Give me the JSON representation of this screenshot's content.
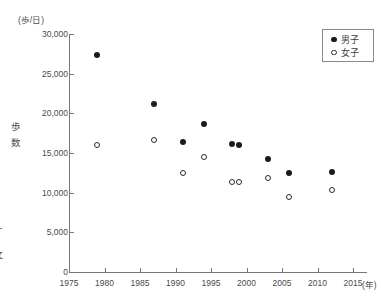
{
  "labels": {
    "y_unit": "(歩/日)",
    "y_axis": "歩数",
    "x_unit": "(年)"
  },
  "legend": {
    "items": [
      {
        "label": "男子",
        "marker": "filled-circle"
      },
      {
        "label": "女子",
        "marker": "open-circle"
      }
    ]
  },
  "edge_fragments": [
    "ー",
    "●",
    "攵"
  ],
  "chart_data": {
    "type": "scatter",
    "title": "",
    "xlabel": "(年)",
    "ylabel": "歩数 (歩/日)",
    "xlim": [
      1975,
      2017
    ],
    "ylim": [
      0,
      30000
    ],
    "x_ticks": [
      1975,
      1980,
      1985,
      1990,
      1995,
      2000,
      2005,
      2010,
      2015
    ],
    "y_ticks": [
      0,
      5000,
      10000,
      15000,
      20000,
      25000,
      30000
    ],
    "grid": false,
    "legend_position": "top-right",
    "series": [
      {
        "id": "boys",
        "name": "男子",
        "marker": "filled-circle",
        "points": [
          [
            1979,
            27400
          ],
          [
            1987,
            21200
          ],
          [
            1991,
            16400
          ],
          [
            1994,
            18700
          ],
          [
            1998,
            16100
          ],
          [
            1999,
            16000
          ],
          [
            2003,
            14300
          ],
          [
            2006,
            12500
          ],
          [
            2012,
            12600
          ]
        ]
      },
      {
        "id": "girls",
        "name": "女子",
        "marker": "open-circle",
        "points": [
          [
            1979,
            16000
          ],
          [
            1987,
            16600
          ],
          [
            1991,
            12500
          ],
          [
            1994,
            14500
          ],
          [
            1998,
            11400
          ],
          [
            1999,
            11400
          ],
          [
            2003,
            11800
          ],
          [
            2006,
            9500
          ],
          [
            2012,
            10300
          ]
        ]
      }
    ]
  }
}
